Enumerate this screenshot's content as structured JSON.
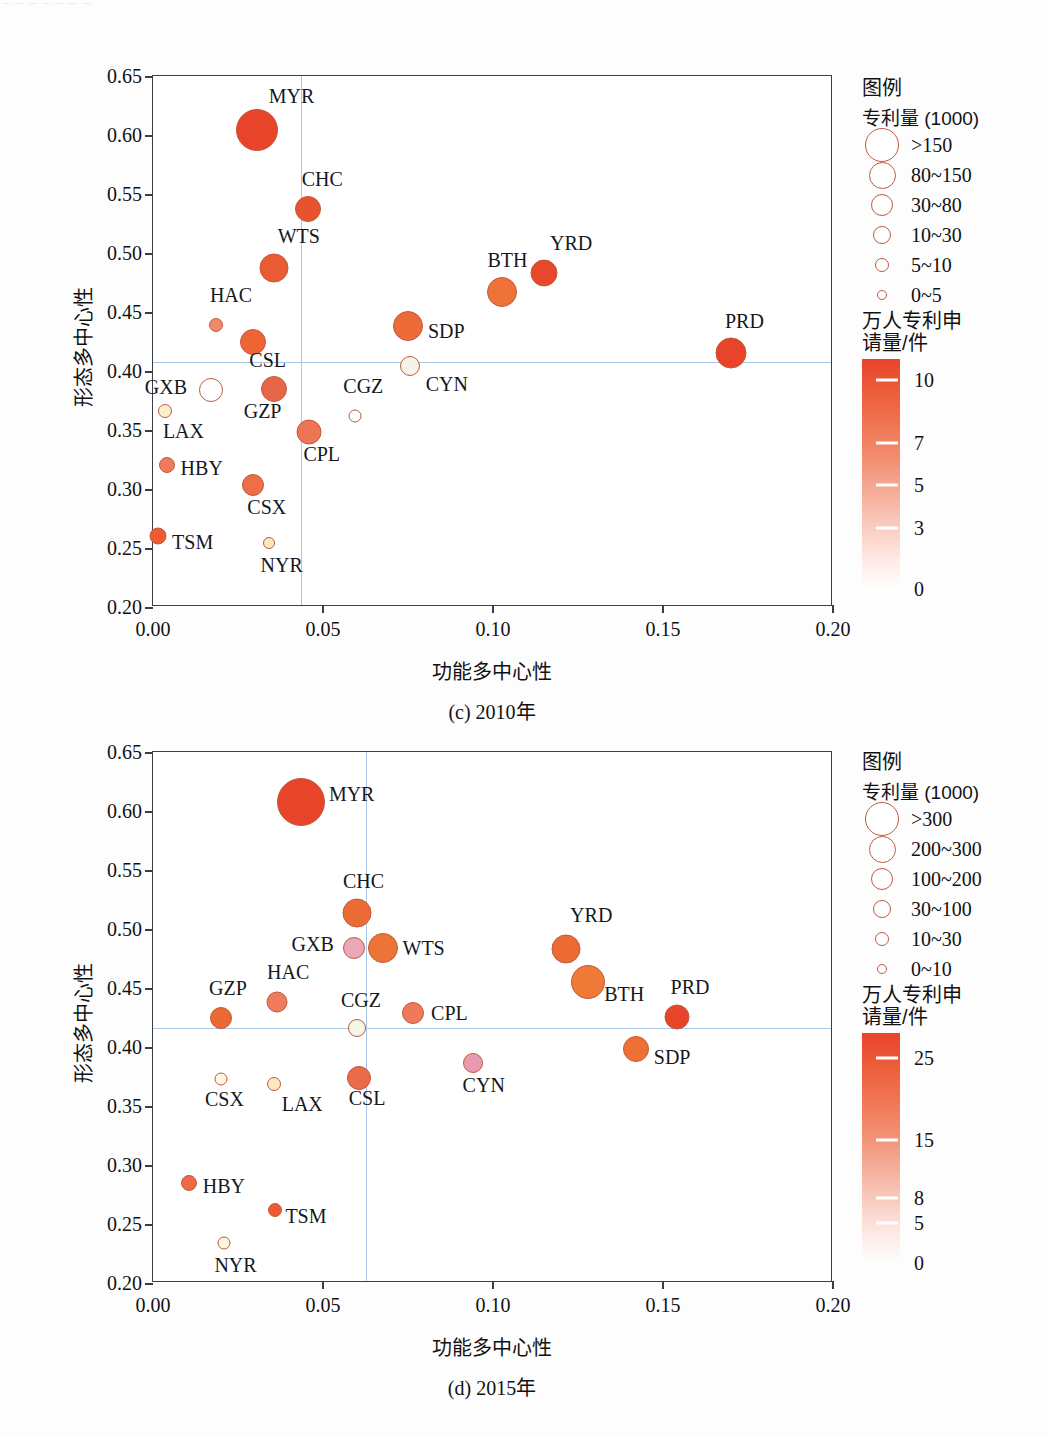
{
  "top_fragment": "᠁ ᠁ ᠁ ᠁ ᠁ ᠁ ᠁",
  "axis_titles": {
    "x": "功能多中心性",
    "y": "形态多中心性"
  },
  "palette": {
    "bubble_stroke": "#c05a3e",
    "quadrant_line": "#a9c8e8",
    "frame": "#3a3f46",
    "cbar_top": "#e8442a",
    "cbar_bottom": "#ffffff"
  },
  "chart_data": [
    {
      "type": "scatter",
      "title": "(c) 2010年",
      "xlabel": "功能多中心性",
      "ylabel": "形态多中心性",
      "xlim": [
        0.0,
        0.2
      ],
      "ylim": [
        0.2,
        0.65
      ],
      "xticks": [
        "0.00",
        "0.05",
        "0.10",
        "0.15",
        "0.20"
      ],
      "xtickvals": [
        0.0,
        0.05,
        0.1,
        0.15,
        0.2
      ],
      "yticks": [
        "0.20",
        "0.25",
        "0.30",
        "0.35",
        "0.40",
        "0.45",
        "0.50",
        "0.55",
        "0.60",
        "0.65"
      ],
      "ytickvals": [
        0.2,
        0.25,
        0.3,
        0.35,
        0.4,
        0.45,
        0.5,
        0.55,
        0.6,
        0.65
      ],
      "quadrant": {
        "x": 0.0435,
        "y": 0.4075
      },
      "grid": false,
      "size_legend": {
        "title": "图例",
        "subtitle": "专利量 (1000)",
        "entries": [
          {
            "label": ">150",
            "r": 17
          },
          {
            "label": "80~150",
            "r": 13.5
          },
          {
            "label": "30~80",
            "r": 11
          },
          {
            "label": "10~30",
            "r": 9
          },
          {
            "label": "5~10",
            "r": 7
          },
          {
            "label": "0~5",
            "r": 5
          }
        ]
      },
      "colorbar": {
        "caption": "万人专利申\n请量/件",
        "ticks": [
          "10",
          "7",
          "5",
          "3",
          "0"
        ],
        "tickvals": [
          10,
          7,
          5,
          3,
          0
        ],
        "vmin": 0,
        "vmax": 11
      },
      "points": [
        {
          "name": "MYR",
          "x": 0.0305,
          "y": 0.6045,
          "r": 21,
          "color": "#e8442a",
          "lx": 12,
          "ly": -34
        },
        {
          "name": "CHC",
          "x": 0.0455,
          "y": 0.537,
          "r": 13,
          "color": "#e8532f",
          "lx": -6,
          "ly": -30
        },
        {
          "name": "WTS",
          "x": 0.0355,
          "y": 0.4875,
          "r": 14.5,
          "color": "#ea5a33",
          "lx": 4,
          "ly": -32
        },
        {
          "name": "YRD",
          "x": 0.115,
          "y": 0.483,
          "r": 13.5,
          "color": "#e8472b",
          "lx": 6,
          "ly": -30
        },
        {
          "name": "BTH",
          "x": 0.1025,
          "y": 0.467,
          "r": 15,
          "color": "#ef7338",
          "lx": -14,
          "ly": -32
        },
        {
          "name": "HAC",
          "x": 0.0185,
          "y": 0.439,
          "r": 7,
          "color": "#ef8b6a",
          "lx": -6,
          "ly": -30
        },
        {
          "name": "SDP",
          "x": 0.075,
          "y": 0.4385,
          "r": 15,
          "color": "#ec6b38",
          "lx": 20,
          "ly": 5
        },
        {
          "name": "CSL",
          "x": 0.0295,
          "y": 0.425,
          "r": 13,
          "color": "#ee6434",
          "lx": -4,
          "ly": 18
        },
        {
          "name": "PRD",
          "x": 0.17,
          "y": 0.415,
          "r": 15.5,
          "color": "#e8442a",
          "lx": -6,
          "ly": -32
        },
        {
          "name": "CYN",
          "x": 0.0755,
          "y": 0.404,
          "r": 10,
          "color": "#f6f3ea",
          "lx": 16,
          "ly": 18
        },
        {
          "name": "GZP",
          "x": 0.0355,
          "y": 0.3845,
          "r": 13,
          "color": "#e7664a",
          "lx": -30,
          "ly": 22
        },
        {
          "name": "GXB",
          "x": 0.017,
          "y": 0.3835,
          "r": 12,
          "color": "#ffffff",
          "lx": -66,
          "ly": -3
        },
        {
          "name": "LAX",
          "x": 0.0035,
          "y": 0.3665,
          "r": 7,
          "color": "#fbefc9",
          "lx": -2,
          "ly": 20
        },
        {
          "name": "CGZ",
          "x": 0.0595,
          "y": 0.3615,
          "r": 6.5,
          "color": "#ffffff",
          "lx": -12,
          "ly": -30
        },
        {
          "name": "CPL",
          "x": 0.046,
          "y": 0.3485,
          "r": 12.5,
          "color": "#ee7456",
          "lx": -6,
          "ly": 22
        },
        {
          "name": "HBY",
          "x": 0.004,
          "y": 0.3205,
          "r": 8,
          "color": "#ef7a5a",
          "lx": 14,
          "ly": 3
        },
        {
          "name": "CSX",
          "x": 0.0295,
          "y": 0.303,
          "r": 11,
          "color": "#ec6f48",
          "lx": -6,
          "ly": 22
        },
        {
          "name": "TSM",
          "x": 0.0015,
          "y": 0.2605,
          "r": 8.5,
          "color": "#ee5c32",
          "lx": 14,
          "ly": 6
        },
        {
          "name": "NYR",
          "x": 0.034,
          "y": 0.2545,
          "r": 6,
          "color": "#fbe8bd",
          "lx": -8,
          "ly": 22
        }
      ]
    },
    {
      "type": "scatter",
      "title": "(d) 2015年",
      "xlabel": "功能多中心性",
      "ylabel": "形态多中心性",
      "xlim": [
        0.0,
        0.2
      ],
      "ylim": [
        0.2,
        0.65
      ],
      "xticks": [
        "0.00",
        "0.05",
        "0.10",
        "0.15",
        "0.20"
      ],
      "xtickvals": [
        0.0,
        0.05,
        0.1,
        0.15,
        0.2
      ],
      "yticks": [
        "0.20",
        "0.25",
        "0.30",
        "0.35",
        "0.40",
        "0.45",
        "0.50",
        "0.55",
        "0.60",
        "0.65"
      ],
      "ytickvals": [
        0.2,
        0.25,
        0.3,
        0.35,
        0.4,
        0.45,
        0.5,
        0.55,
        0.6,
        0.65
      ],
      "quadrant": {
        "x": 0.0625,
        "y": 0.4165
      },
      "grid": false,
      "size_legend": {
        "title": "图例",
        "subtitle": "专利量 (1000)",
        "entries": [
          {
            "label": ">300",
            "r": 17
          },
          {
            "label": "200~300",
            "r": 13.5
          },
          {
            "label": "100~200",
            "r": 11
          },
          {
            "label": "30~100",
            "r": 9
          },
          {
            "label": "10~30",
            "r": 7
          },
          {
            "label": "0~10",
            "r": 5
          }
        ]
      },
      "colorbar": {
        "caption": "万人专利申\n请量/件",
        "ticks": [
          "25",
          "15",
          "8",
          "5",
          "0"
        ],
        "tickvals": [
          25,
          15,
          8,
          5,
          0
        ],
        "vmin": 0,
        "vmax": 28
      },
      "points": [
        {
          "name": "MYR",
          "x": 0.0435,
          "y": 0.6075,
          "r": 24,
          "color": "#e8442a",
          "lx": 28,
          "ly": -8
        },
        {
          "name": "CHC",
          "x": 0.06,
          "y": 0.5135,
          "r": 14.5,
          "color": "#ec6a34",
          "lx": -14,
          "ly": -32
        },
        {
          "name": "YRD",
          "x": 0.1215,
          "y": 0.483,
          "r": 14.5,
          "color": "#ec6a34",
          "lx": 4,
          "ly": -34
        },
        {
          "name": "GXB",
          "x": 0.059,
          "y": 0.484,
          "r": 11,
          "color": "#e8a8b8",
          "lx": -62,
          "ly": -4
        },
        {
          "name": "WTS",
          "x": 0.0675,
          "y": 0.4835,
          "r": 15,
          "color": "#ed7437",
          "lx": 20,
          "ly": 0
        },
        {
          "name": "BTH",
          "x": 0.128,
          "y": 0.4555,
          "r": 17,
          "color": "#ef7a38",
          "lx": 16,
          "ly": 12
        },
        {
          "name": "HAC",
          "x": 0.0365,
          "y": 0.438,
          "r": 10.5,
          "color": "#ef7b5c",
          "lx": -10,
          "ly": -30
        },
        {
          "name": "CPL",
          "x": 0.0765,
          "y": 0.429,
          "r": 11,
          "color": "#ef7a5a",
          "lx": 18,
          "ly": 0
        },
        {
          "name": "PRD",
          "x": 0.154,
          "y": 0.4255,
          "r": 12.5,
          "color": "#e8442a",
          "lx": -6,
          "ly": -30
        },
        {
          "name": "GZP",
          "x": 0.02,
          "y": 0.4245,
          "r": 11,
          "color": "#ea6a32",
          "lx": -12,
          "ly": -30
        },
        {
          "name": "CGZ",
          "x": 0.06,
          "y": 0.4165,
          "r": 9,
          "color": "#f5f8e6",
          "lx": -16,
          "ly": -28
        },
        {
          "name": "SDP",
          "x": 0.142,
          "y": 0.3985,
          "r": 13,
          "color": "#ee7134",
          "lx": 18,
          "ly": 8
        },
        {
          "name": "CYN",
          "x": 0.094,
          "y": 0.3865,
          "r": 10,
          "color": "#ea9ab0",
          "lx": -10,
          "ly": 22
        },
        {
          "name": "CSL",
          "x": 0.0605,
          "y": 0.374,
          "r": 12,
          "color": "#eb6a4a",
          "lx": -10,
          "ly": 20
        },
        {
          "name": "CSX",
          "x": 0.02,
          "y": 0.373,
          "r": 6.5,
          "color": "#fdf6e0",
          "lx": -16,
          "ly": 20
        },
        {
          "name": "LAX",
          "x": 0.0355,
          "y": 0.369,
          "r": 7,
          "color": "#fbe8bd",
          "lx": 8,
          "ly": 20
        },
        {
          "name": "HBY",
          "x": 0.0105,
          "y": 0.2845,
          "r": 8,
          "color": "#ee6a48",
          "lx": 14,
          "ly": 3
        },
        {
          "name": "TSM",
          "x": 0.036,
          "y": 0.262,
          "r": 7,
          "color": "#ec5a34",
          "lx": 10,
          "ly": 6
        },
        {
          "name": "NYR",
          "x": 0.021,
          "y": 0.234,
          "r": 6.5,
          "color": "#fcf6da",
          "lx": -10,
          "ly": 22
        }
      ]
    }
  ]
}
